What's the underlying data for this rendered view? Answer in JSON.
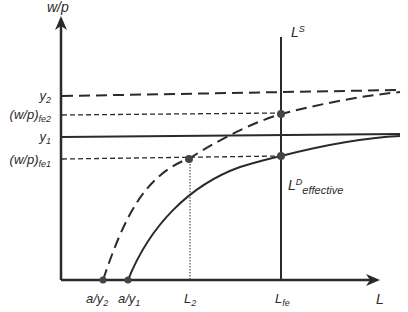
{
  "diagram": {
    "axes": {
      "y_label": "w/p",
      "x_label": "L"
    },
    "y_ticks": [
      {
        "id": "y2",
        "base": "y",
        "sub": "2"
      },
      {
        "id": "wp_fe2",
        "base": "(w/p)",
        "sub": "fe2"
      },
      {
        "id": "y1",
        "base": "y",
        "sub": "1"
      },
      {
        "id": "wp_fe1",
        "base": "(w/p)",
        "sub": "fe1"
      }
    ],
    "x_ticks": [
      {
        "id": "a_y2",
        "base": "a/y",
        "sub": "2"
      },
      {
        "id": "a_y1",
        "base": "a/y",
        "sub": "1"
      },
      {
        "id": "L2",
        "base": "L",
        "sub": "2"
      },
      {
        "id": "Lfe",
        "base": "L",
        "sub": "fe"
      }
    ],
    "curves": {
      "labor_supply": {
        "base": "L",
        "sup": "S"
      },
      "labor_demand": {
        "base": "L",
        "sup": "D",
        "sub": "effective"
      }
    },
    "colors": {
      "line": "#2a2a2a",
      "point": "#444444"
    }
  }
}
